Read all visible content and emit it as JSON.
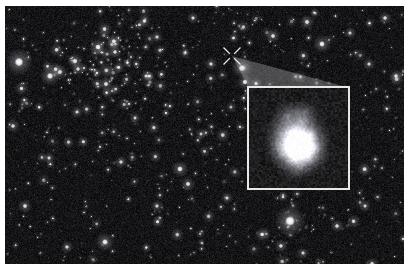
{
  "figure": {
    "domain": "astronomy-deep-field",
    "border_color": "#ffffff",
    "background_color": "#121214",
    "frame": {
      "x": 5,
      "y": 6,
      "width": 399,
      "height": 258
    }
  },
  "starfield": {
    "description": "Dense deep-field exposure of faint point sources and small extended galaxies on a near-black sky background.",
    "sky_color": "#141416",
    "noise_color": "#2a2a2e",
    "star_color": "#ffffff",
    "galaxy_color": "#b9b9be",
    "seed": 20240617,
    "star_count": 520,
    "faint_count": 1600,
    "bright_stars": [
      {
        "x": 14,
        "y": 56,
        "r": 4.4,
        "i": 1.0
      },
      {
        "x": 45,
        "y": 70,
        "r": 3.2,
        "i": 0.92
      },
      {
        "x": 55,
        "y": 66,
        "r": 2.4,
        "i": 0.8
      },
      {
        "x": 73,
        "y": 63,
        "r": 2.2,
        "i": 0.78
      },
      {
        "x": 70,
        "y": 55,
        "r": 2.6,
        "i": 0.85
      },
      {
        "x": 93,
        "y": 41,
        "r": 2.8,
        "i": 0.9
      },
      {
        "x": 110,
        "y": 46,
        "r": 2.2,
        "i": 0.8
      },
      {
        "x": 101,
        "y": 78,
        "r": 2.4,
        "i": 0.82
      },
      {
        "x": 141,
        "y": 70,
        "r": 1.9,
        "i": 0.75
      },
      {
        "x": 152,
        "y": 31,
        "r": 2.0,
        "i": 0.76
      },
      {
        "x": 188,
        "y": 12,
        "r": 2.0,
        "i": 0.8
      },
      {
        "x": 206,
        "y": 58,
        "r": 2.1,
        "i": 0.78
      },
      {
        "x": 237,
        "y": 62,
        "r": 3.4,
        "i": 0.96
      },
      {
        "x": 268,
        "y": 30,
        "r": 2.3,
        "i": 0.82
      },
      {
        "x": 302,
        "y": 16,
        "r": 2.4,
        "i": 0.84
      },
      {
        "x": 317,
        "y": 38,
        "r": 2.9,
        "i": 0.9
      },
      {
        "x": 345,
        "y": 27,
        "r": 2.0,
        "i": 0.76
      },
      {
        "x": 380,
        "y": 12,
        "r": 2.2,
        "i": 0.8
      },
      {
        "x": 364,
        "y": 58,
        "r": 2.0,
        "i": 0.78
      },
      {
        "x": 391,
        "y": 70,
        "r": 2.2,
        "i": 0.8
      },
      {
        "x": 285,
        "y": 215,
        "r": 5.0,
        "i": 1.0
      },
      {
        "x": 240,
        "y": 76,
        "r": 2.6,
        "i": 0.86
      },
      {
        "x": 20,
        "y": 200,
        "r": 2.3,
        "i": 0.82
      },
      {
        "x": 100,
        "y": 236,
        "r": 3.0,
        "i": 0.9
      },
      {
        "x": 62,
        "y": 241,
        "r": 2.1,
        "i": 0.78
      },
      {
        "x": 175,
        "y": 163,
        "r": 2.8,
        "i": 0.88
      },
      {
        "x": 183,
        "y": 178,
        "r": 2.4,
        "i": 0.84
      },
      {
        "x": 152,
        "y": 200,
        "r": 2.0,
        "i": 0.78
      },
      {
        "x": 116,
        "y": 156,
        "r": 2.1,
        "i": 0.78
      },
      {
        "x": 44,
        "y": 152,
        "r": 2.0,
        "i": 0.76
      },
      {
        "x": 8,
        "y": 120,
        "r": 2.2,
        "i": 0.8
      },
      {
        "x": 222,
        "y": 192,
        "r": 2.0,
        "i": 0.76
      },
      {
        "x": 332,
        "y": 220,
        "r": 2.2,
        "i": 0.8
      },
      {
        "x": 360,
        "y": 200,
        "r": 2.0,
        "i": 0.76
      },
      {
        "x": 298,
        "y": 247,
        "r": 2.0,
        "i": 0.76
      },
      {
        "x": 130,
        "y": 112,
        "r": 1.9,
        "i": 0.74
      },
      {
        "x": 196,
        "y": 128,
        "r": 1.9,
        "i": 0.74
      },
      {
        "x": 72,
        "y": 106,
        "r": 2.0,
        "i": 0.76
      }
    ],
    "cluster": {
      "x": 105,
      "y": 58,
      "radius": 58,
      "label": "galaxy-cluster-concentration"
    }
  },
  "marker": {
    "name": "target-source-marker",
    "shape": "diagonal-cross",
    "x": 227,
    "y": 50,
    "arm_length": 9,
    "gap": 3,
    "color": "#f2f2f0",
    "line_width": 1.2
  },
  "wedge": {
    "name": "zoom-indicator-wedge",
    "fill": "rgba(210,210,212,0.30)",
    "apex": {
      "x": 227,
      "y": 50
    },
    "left_corner": {
      "x": 244,
      "y": 82
    },
    "right_corner": {
      "x": 345,
      "y": 82
    }
  },
  "inset": {
    "name": "magnified-source-inset",
    "border_color": "#e8e8e6",
    "border_width": 2,
    "x": 242,
    "y": 80,
    "width": 103,
    "height": 104,
    "background": "#161618",
    "object": {
      "label": "irregular-clumpy-galaxy",
      "core": {
        "cx": 0.5,
        "cy": 0.58,
        "radius": 0.11,
        "color": "#ffffff"
      },
      "clumps": [
        {
          "cx": 0.5,
          "cy": 0.58,
          "r": 0.155,
          "level": 0.98
        },
        {
          "cx": 0.44,
          "cy": 0.44,
          "r": 0.135,
          "level": 0.6
        },
        {
          "cx": 0.52,
          "cy": 0.34,
          "r": 0.115,
          "level": 0.55
        },
        {
          "cx": 0.39,
          "cy": 0.28,
          "r": 0.09,
          "level": 0.42
        },
        {
          "cx": 0.32,
          "cy": 0.46,
          "r": 0.095,
          "level": 0.45
        },
        {
          "cx": 0.63,
          "cy": 0.47,
          "r": 0.105,
          "level": 0.5
        },
        {
          "cx": 0.67,
          "cy": 0.6,
          "r": 0.09,
          "level": 0.44
        },
        {
          "cx": 0.62,
          "cy": 0.7,
          "r": 0.1,
          "level": 0.46
        },
        {
          "cx": 0.45,
          "cy": 0.72,
          "r": 0.11,
          "level": 0.48
        },
        {
          "cx": 0.33,
          "cy": 0.66,
          "r": 0.085,
          "level": 0.36
        },
        {
          "cx": 0.57,
          "cy": 0.24,
          "r": 0.07,
          "level": 0.33
        },
        {
          "cx": 0.28,
          "cy": 0.58,
          "r": 0.07,
          "level": 0.3
        },
        {
          "cx": 0.5,
          "cy": 0.8,
          "r": 0.08,
          "level": 0.3
        }
      ],
      "noise_level": 0.16,
      "noise_color": "#3a3a40"
    }
  }
}
